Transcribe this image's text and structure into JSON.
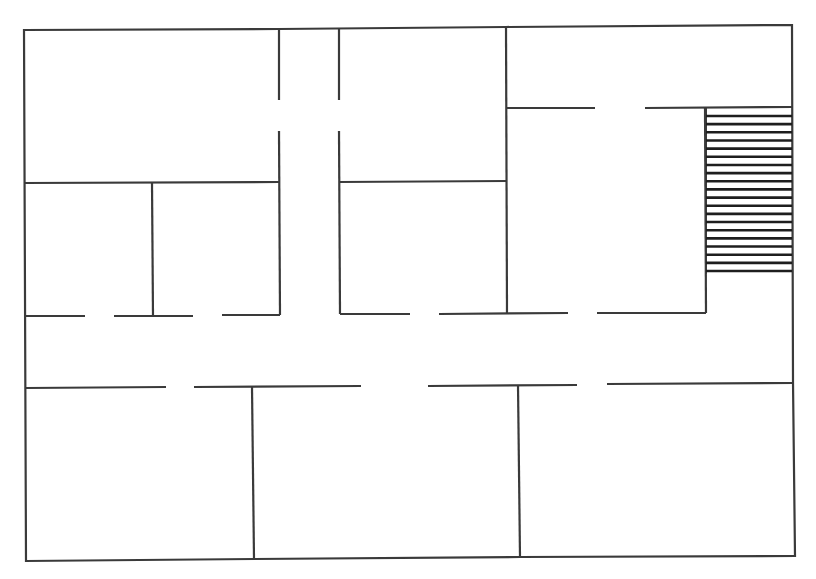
{
  "diagram": {
    "type": "floor-plan",
    "wall_color": "#3a3a3a",
    "background": "#ffffff",
    "rooms": [
      {
        "id": "top-left-room"
      },
      {
        "id": "top-center-room"
      },
      {
        "id": "top-right-room"
      },
      {
        "id": "middle-left-small-room"
      },
      {
        "id": "middle-left-room"
      },
      {
        "id": "middle-center-room"
      },
      {
        "id": "middle-right-room"
      },
      {
        "id": "bottom-left-room"
      },
      {
        "id": "bottom-center-room"
      },
      {
        "id": "bottom-right-room"
      },
      {
        "id": "vertical-corridor"
      },
      {
        "id": "horizontal-corridor"
      }
    ],
    "stairs": {
      "steps": 20
    }
  }
}
